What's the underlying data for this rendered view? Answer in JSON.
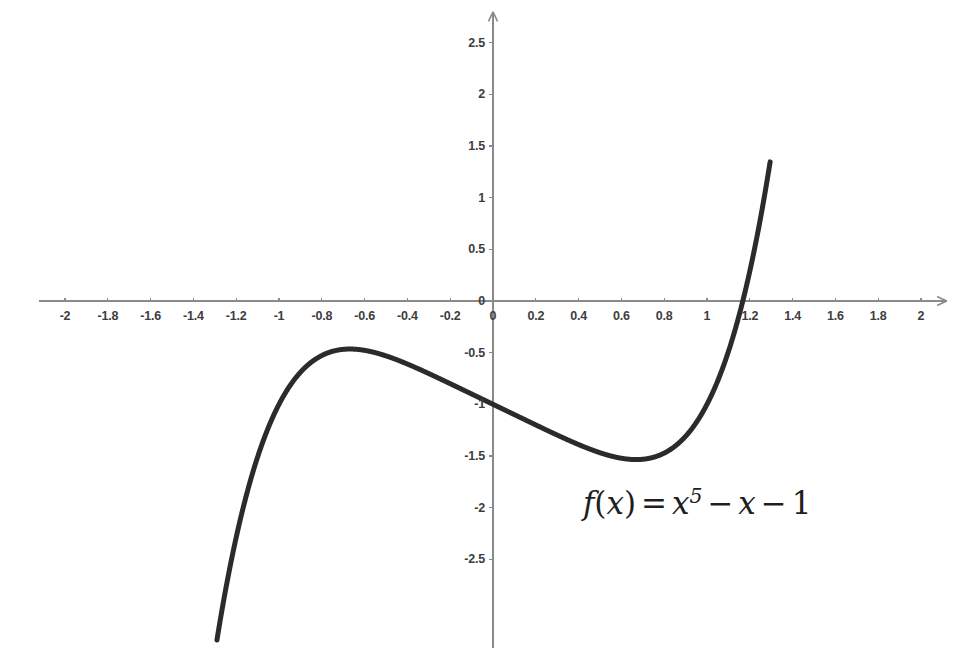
{
  "chart_data": {
    "type": "line",
    "title": "",
    "subtitle": "",
    "xlabel": "",
    "ylabel": "",
    "xlim": [
      -2.12,
      2.12
    ],
    "ylim": [
      -3.2,
      2.8
    ],
    "grid": false,
    "legend": null,
    "annotations": [
      {
        "name": "function-formula",
        "text": "f(x) = x^5 - x - 1",
        "latex": "f(x) = x^5 - x - 1",
        "x_data": 0.42,
        "y_data": -2.0
      }
    ],
    "x_ticks": [
      -2,
      -1.8,
      -1.6,
      -1.4,
      -1.2,
      -1,
      -0.8,
      -0.6,
      -0.4,
      -0.2,
      0,
      0.2,
      0.4,
      0.6,
      0.8,
      1,
      1.2,
      1.4,
      1.6,
      1.8,
      2
    ],
    "x_tick_labels": [
      "-2",
      "-1.8",
      "-1.6",
      "-1.4",
      "-1.2",
      "-1",
      "-0.8",
      "-0.6",
      "-0.4",
      "-0.2",
      "0",
      "0.2",
      "0.4",
      "0.6",
      "0.8",
      "1",
      "1.2",
      "1.4",
      "1.6",
      "1.8",
      "2"
    ],
    "y_ticks": [
      -2.5,
      -2,
      -1.5,
      -1,
      -0.5,
      0,
      0.5,
      1,
      1.5,
      2,
      2.5
    ],
    "y_tick_labels": [
      "-2.5",
      "-2",
      "-1.5",
      "-1",
      "-0.5",
      "0",
      "0.5",
      "1",
      "1.5",
      "2",
      "2.5"
    ],
    "series": [
      {
        "name": "f(x) = x^5 - x - 1",
        "expression": "x**5 - x - 1",
        "color": "#2b2b2b",
        "line_width": 5,
        "x_domain": [
          -1.29,
          1.295
        ],
        "features": {
          "local_maximum": {
            "x": -0.6687,
            "y": -0.4651
          },
          "local_minimum": {
            "x": 0.6687,
            "y": -1.5349
          },
          "real_root": {
            "x": 1.1673,
            "y": 0
          },
          "y_intercept": {
            "x": 0,
            "y": -1
          }
        },
        "points": [
          {
            "x": -1.29,
            "y": -3.2782
          },
          {
            "x": -1.25,
            "y": -2.8018
          },
          {
            "x": -1.2,
            "y": -2.2883
          },
          {
            "x": -1.15,
            "y": -1.8603
          },
          {
            "x": -1.1,
            "y": -1.5105
          },
          {
            "x": -1.05,
            "y": -1.2276
          },
          {
            "x": -1.0,
            "y": -1.0
          },
          {
            "x": -0.95,
            "y": -0.824
          },
          {
            "x": -0.9,
            "y": -0.6905
          },
          {
            "x": -0.85,
            "y": -0.5937
          },
          {
            "x": -0.8,
            "y": -0.5277
          },
          {
            "x": -0.75,
            "y": -0.4873
          },
          {
            "x": -0.7,
            "y": -0.4681
          },
          {
            "x": -0.6687,
            "y": -0.4651
          },
          {
            "x": -0.65,
            "y": -0.466
          },
          {
            "x": -0.6,
            "y": -0.4778
          },
          {
            "x": -0.55,
            "y": -0.5003
          },
          {
            "x": -0.5,
            "y": -0.5313
          },
          {
            "x": -0.4,
            "y": -0.6102
          },
          {
            "x": -0.3,
            "y": -0.7024
          },
          {
            "x": -0.2,
            "y": -0.8003
          },
          {
            "x": -0.1,
            "y": -0.9
          },
          {
            "x": 0.0,
            "y": -1.0
          },
          {
            "x": 0.1,
            "y": -1.1
          },
          {
            "x": 0.2,
            "y": -1.1997
          },
          {
            "x": 0.3,
            "y": -1.2976
          },
          {
            "x": 0.4,
            "y": -1.3898
          },
          {
            "x": 0.5,
            "y": -1.4688
          },
          {
            "x": 0.55,
            "y": -1.4997
          },
          {
            "x": 0.6,
            "y": -1.5222
          },
          {
            "x": 0.65,
            "y": -1.534
          },
          {
            "x": 0.6687,
            "y": -1.5349
          },
          {
            "x": 0.7,
            "y": -1.5319
          },
          {
            "x": 0.75,
            "y": -1.5127
          },
          {
            "x": 0.8,
            "y": -1.4723
          },
          {
            "x": 0.85,
            "y": -1.4063
          },
          {
            "x": 0.9,
            "y": -1.3095
          },
          {
            "x": 0.95,
            "y": -1.176
          },
          {
            "x": 1.0,
            "y": -1.0
          },
          {
            "x": 1.05,
            "y": -0.7724
          },
          {
            "x": 1.1,
            "y": -0.4895
          },
          {
            "x": 1.1673,
            "y": 0.0
          },
          {
            "x": 1.2,
            "y": 0.2883
          },
          {
            "x": 1.25,
            "y": 0.8018
          },
          {
            "x": 1.295,
            "y": 1.3441
          },
          {
            "x": 1.295,
            "y": 2.6
          }
        ]
      }
    ],
    "axes_style": {
      "axis_color": "#8a8a8a",
      "axis_line_width": 1.6,
      "arrows": true,
      "origin_px": {
        "x": 493,
        "y": 301
      },
      "px_per_unit_x": 214,
      "px_per_unit_y": 103.3,
      "tick_label_color": "#3d3d3d"
    },
    "background_color": "#ffffff"
  }
}
